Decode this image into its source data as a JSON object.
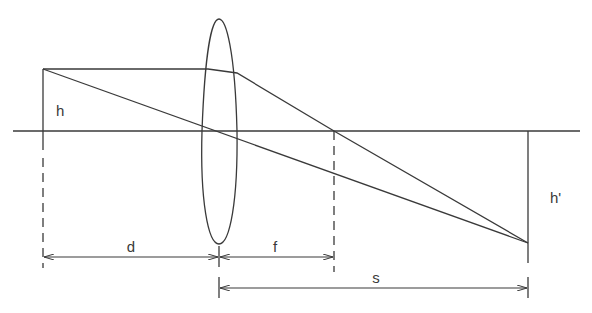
{
  "diagram": {
    "type": "thin lens ray diagram",
    "labels": {
      "object_height": "h",
      "image_height": "h'",
      "object_distance": "d",
      "focal_length": "f",
      "image_distance": "s"
    },
    "colors": {
      "stroke": "#3a3a3a",
      "background": "#ffffff"
    }
  }
}
